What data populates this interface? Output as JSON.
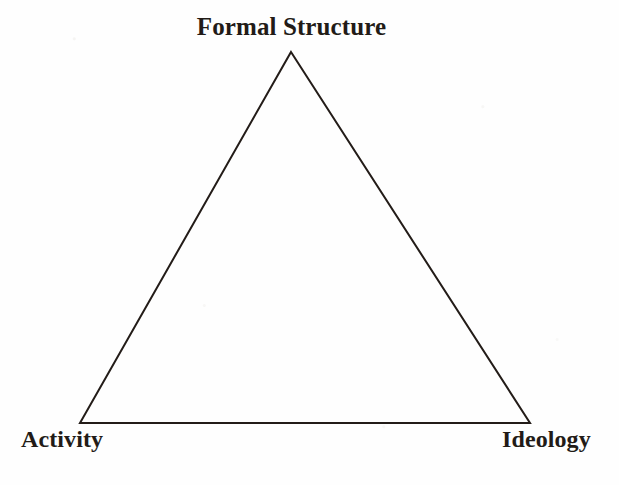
{
  "diagram": {
    "type": "triangle-model",
    "title": "Formal Structure",
    "background_color": "#fefefe",
    "stroke_color": "#231c18",
    "text_color": "#221b17",
    "vertices": [
      {
        "id": "apex",
        "label": "Formal Structure",
        "x": 291,
        "y": 52
      },
      {
        "id": "bottom-left",
        "label": "Activity",
        "x": 80,
        "y": 423
      },
      {
        "id": "bottom-right",
        "label": "Ideology",
        "x": 530,
        "y": 423
      }
    ],
    "labels": {
      "apex": "Formal Structure",
      "bottom_left": "Activity",
      "bottom_right": "Ideology"
    },
    "stroke_width": 2
  }
}
